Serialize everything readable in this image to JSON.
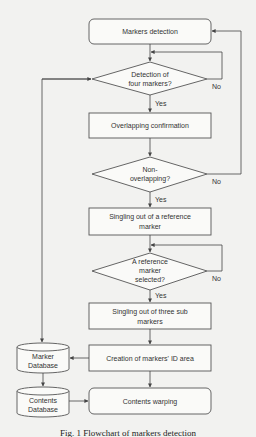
{
  "diagram": {
    "nodes": {
      "markers_detection": "Markers detection",
      "detection_four_l1": "Detection of",
      "detection_four_l2": "four markers?",
      "overlapping_confirmation": "Overlapping confirmation",
      "non_overlapping_l1": "Non-",
      "non_overlapping_l2": "overlapping?",
      "singling_ref_l1": "Singling out of a reference",
      "singling_ref_l2": "marker",
      "ref_selected_l1": "A reference",
      "ref_selected_l2": "marker",
      "ref_selected_l3": "selected?",
      "singling_three_l1": "Singling out of three sub",
      "singling_three_l2": "markers",
      "creation_id_area": "Creation of  markers' ID area",
      "contents_warping": "Contents warping",
      "marker_db_l1": "Marker",
      "marker_db_l2": "Database",
      "contents_db_l1": "Contents",
      "contents_db_l2": "Database"
    },
    "edge_labels": {
      "yes1": "Yes",
      "no1": "No",
      "yes2": "Yes",
      "no2": "No",
      "yes3": "Yes",
      "no3": "No"
    },
    "caption": "Fig. 1 Flowchart of markers detection"
  }
}
